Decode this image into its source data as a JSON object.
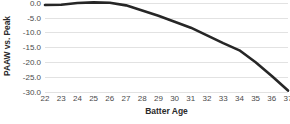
{
  "chart_data": {
    "type": "line",
    "title": "",
    "subtitle": "",
    "xlabel": "Batter Age",
    "ylabel": "PAAW vs. Peak",
    "xlim": [
      22,
      37
    ],
    "ylim": [
      -30.0,
      0.9
    ],
    "grid": true,
    "legend": false,
    "legend_position": "none",
    "line_color": "#262626",
    "grid_color": "#e2e2e2",
    "background_color": "#ffffff",
    "xticks": [
      22,
      23,
      24,
      25,
      26,
      27,
      28,
      29,
      30,
      31,
      32,
      33,
      34,
      35,
      36,
      37
    ],
    "xtick_labels": [
      "22",
      "23",
      "24",
      "25",
      "26",
      "27",
      "28",
      "29",
      "30",
      "31",
      "32",
      "33",
      "34",
      "35",
      "36",
      "37"
    ],
    "yticks": [
      0.0,
      -5.0,
      -10.0,
      -15.0,
      -20.0,
      -25.0,
      -30.0
    ],
    "ytick_labels": [
      "0.0",
      "-5.0",
      "-10.0",
      "-15.0",
      "-20.0",
      "-25.0",
      "-30.0"
    ],
    "x": [
      22,
      23,
      24,
      25,
      26,
      27,
      28,
      29,
      30,
      31,
      32,
      33,
      34,
      35,
      36,
      37
    ],
    "values": [
      -0.8,
      -0.7,
      -0.1,
      0.1,
      0.0,
      -0.9,
      -2.6,
      -4.4,
      -6.4,
      -8.4,
      -11.0,
      -13.6,
      -16.0,
      -20.0,
      -24.6,
      -29.5
    ],
    "series": [
      {
        "name": "PAAW vs. Peak",
        "values": [
          -0.8,
          -0.7,
          -0.1,
          0.1,
          0.0,
          -0.9,
          -2.6,
          -4.4,
          -6.4,
          -8.4,
          -11.0,
          -13.6,
          -16.0,
          -20.0,
          -24.6,
          -29.5
        ]
      }
    ],
    "annotations": []
  }
}
